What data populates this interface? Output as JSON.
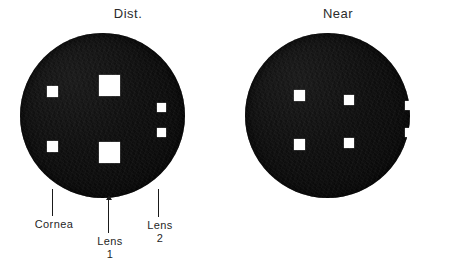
{
  "figure": {
    "background_color": "#ffffff",
    "ink_color": "#1a1a1a",
    "disc_color": "#111111",
    "reflex_color": "#ffffff",
    "panels": [
      {
        "name": "dist",
        "title": "Dist.",
        "title_x": 128,
        "title_y": 6,
        "disc": {
          "left": 20,
          "top": 33,
          "size": 165
        },
        "reflexes": [
          {
            "name": "cornea-upper",
            "group": "cornea",
            "left": 47,
            "top": 86,
            "size": 11
          },
          {
            "name": "cornea-lower",
            "group": "cornea",
            "left": 47,
            "top": 141,
            "size": 11
          },
          {
            "name": "lens1-upper",
            "group": "lens-1",
            "left": 99,
            "top": 75,
            "size": 21
          },
          {
            "name": "lens1-lower",
            "group": "lens-1",
            "left": 99,
            "top": 142,
            "size": 21
          },
          {
            "name": "lens2-upper",
            "group": "lens-2",
            "left": 157,
            "top": 103,
            "size": 9
          },
          {
            "name": "lens2-lower",
            "group": "lens-2",
            "left": 157,
            "top": 128,
            "size": 9
          }
        ]
      },
      {
        "name": "near",
        "title": "Near",
        "title_x": 338,
        "title_y": 6,
        "disc": {
          "left": 245,
          "top": 33,
          "size": 165
        },
        "reflexes": [
          {
            "name": "cornea-upper",
            "group": "cornea",
            "left": 294,
            "top": 90,
            "size": 11
          },
          {
            "name": "cornea-lower",
            "group": "cornea",
            "left": 294,
            "top": 139,
            "size": 11
          },
          {
            "name": "lens1-upper",
            "group": "lens-1",
            "left": 344,
            "top": 95,
            "size": 10
          },
          {
            "name": "lens1-lower",
            "group": "lens-1",
            "left": 344,
            "top": 138,
            "size": 10
          },
          {
            "name": "lens2-upper",
            "group": "lens-2",
            "left": 405,
            "top": 101,
            "size": 9
          },
          {
            "name": "lens2-lower",
            "group": "lens-2",
            "left": 405,
            "top": 128,
            "size": 9
          }
        ]
      }
    ],
    "callouts": [
      {
        "name": "cornea",
        "label": "Cornea",
        "number": "",
        "leader_x": 52,
        "leader_top": 189,
        "leader_height": 27,
        "arrow": false,
        "text_x": 54,
        "text_y": 218
      },
      {
        "name": "lens-1",
        "label": "Lens",
        "number": "1",
        "leader_x": 108,
        "leader_top": 200,
        "leader_height": 33,
        "arrow": true,
        "text_x": 110,
        "text_y": 235
      },
      {
        "name": "lens-2",
        "label": "Lens",
        "number": "2",
        "leader_x": 158,
        "leader_top": 189,
        "leader_height": 28,
        "arrow": false,
        "text_x": 160,
        "text_y": 219
      }
    ]
  }
}
